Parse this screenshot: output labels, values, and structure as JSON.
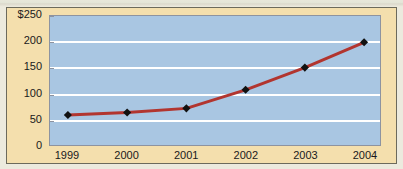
{
  "chart_data": {
    "type": "line",
    "title": "",
    "xlabel": "",
    "ylabel": "",
    "categories": [
      "1999",
      "2000",
      "2001",
      "2002",
      "2003",
      "2004"
    ],
    "values": [
      58,
      63,
      71,
      107,
      150,
      199
    ],
    "series": [
      {
        "name": "",
        "values": [
          58,
          63,
          71,
          107,
          150,
          199
        ]
      }
    ],
    "ylim": [
      0,
      250
    ],
    "yticks": [
      0,
      50,
      100,
      150,
      200,
      250
    ],
    "ytick_labels": [
      "0",
      "50",
      "100",
      "150",
      "200",
      "$250"
    ],
    "gridlines": [
      50,
      100,
      150,
      200
    ],
    "grid": true,
    "legend": "none",
    "currency_symbol": "$",
    "marker": "diamond",
    "colors": {
      "line": "#b2352f",
      "marker": "#111111",
      "plot_background": "#a9c6e2",
      "panel_background": "#f4dfad",
      "gridline": "#ffffff",
      "axis_text": "#19191c",
      "plot_border": "#8d93a0",
      "panel_border": "#6c6a5c"
    }
  }
}
